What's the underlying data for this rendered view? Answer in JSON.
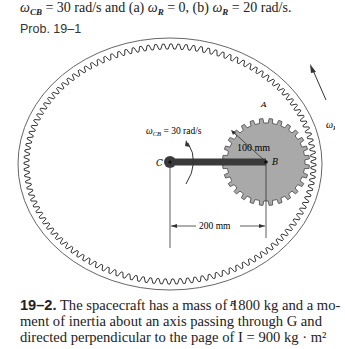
{
  "header": {
    "omega_cb_symbol": "ω",
    "omega_cb_sub": "CB",
    "eq1": " = 30 rad/s and (a) ",
    "omega_r_symbol": "ω",
    "omega_r_sub": "R",
    "eq2": " = 0, (b) ",
    "omega_r2_symbol": "ω",
    "omega_r2_sub": "R",
    "eq3": " = 20 rad/s."
  },
  "prob_label": "Prob. 19–1",
  "figure": {
    "label_A": "A",
    "label_B": "B",
    "label_C": "C",
    "label_R": "R",
    "omega_cb_label": "ω",
    "omega_cb_label_sub": "CB",
    "omega_cb_value": " = 30 rad/s",
    "radius_label": "100 mm",
    "distance_label": "200 mm",
    "omega_r_label": "ω",
    "omega_r_label_sub": "R",
    "colors": {
      "gear_fill": "#a9a9a9",
      "line": "#333333",
      "arm": "#3a3a3a"
    }
  },
  "problem_19_2": {
    "number": "19–2.",
    "line1": " The spacecraft has a mass of 1800 kg and a mo-",
    "line2": "ment of inertia about an axis passing through G and",
    "line3": "directed perpendicular to the page of I  = 900 kg · m²"
  }
}
